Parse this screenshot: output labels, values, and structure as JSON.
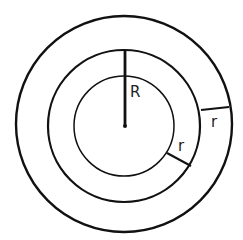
{
  "diagram": {
    "type": "concentric-circles",
    "stroke_color": "#111111",
    "labels": {
      "big_radius": "R",
      "ring_width_inner": "r",
      "ring_width_outer": "r"
    }
  }
}
